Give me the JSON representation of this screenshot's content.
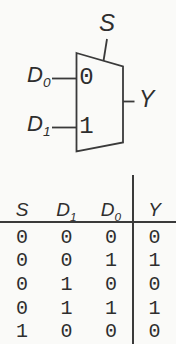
{
  "diagram": {
    "select_label": {
      "base": "S",
      "sub": ""
    },
    "input0_label": {
      "base": "D",
      "sub": "0"
    },
    "input1_label": {
      "base": "D",
      "sub": "1"
    },
    "output_label": {
      "base": "Y",
      "sub": ""
    },
    "port0": "0",
    "port1": "1"
  },
  "table": {
    "headers": [
      {
        "base": "S",
        "sub": ""
      },
      {
        "base": "D",
        "sub": "1"
      },
      {
        "base": "D",
        "sub": "0"
      },
      {
        "base": "Y",
        "sub": ""
      }
    ],
    "rows": [
      [
        "0",
        "0",
        "0",
        "0"
      ],
      [
        "0",
        "0",
        "1",
        "1"
      ],
      [
        "0",
        "1",
        "0",
        "0"
      ],
      [
        "0",
        "1",
        "1",
        "1"
      ],
      [
        "1",
        "0",
        "0",
        "0"
      ]
    ]
  },
  "colors": {
    "ink": "#3a3a3a",
    "text": "#2e2e2e",
    "background": "#fafaf8"
  }
}
